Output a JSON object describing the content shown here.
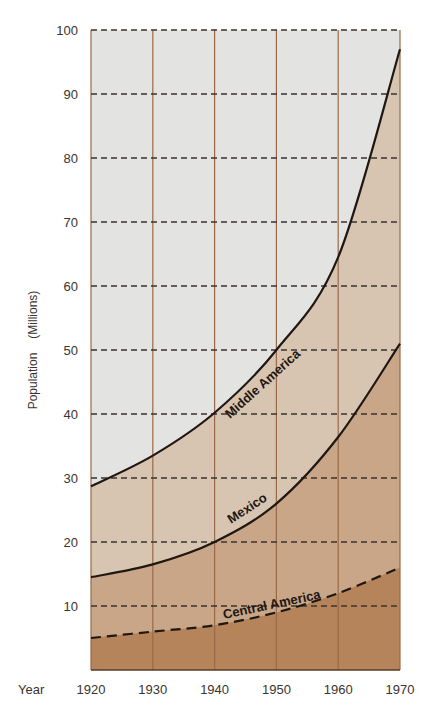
{
  "chart_data": {
    "type": "area",
    "title": "",
    "xlabel": "Year",
    "ylabel": "Population (Millions)",
    "x": [
      1920,
      1930,
      1940,
      1950,
      1960,
      1970
    ],
    "xlim": [
      1920,
      1970
    ],
    "ylim": [
      0,
      100
    ],
    "yticks": [
      10,
      20,
      30,
      40,
      50,
      60,
      70,
      80,
      90,
      100
    ],
    "xticks": [
      1920,
      1930,
      1940,
      1950,
      1960,
      1970
    ],
    "grid": {
      "horizontal": "dashed",
      "vertical": "solid"
    },
    "legend": "inline labels along curves",
    "series": [
      {
        "name": "Middle America",
        "values": [
          28.7,
          33.5,
          40.2,
          50,
          64.5,
          97
        ],
        "line": "solid",
        "fill": "#d8c5b1"
      },
      {
        "name": "Mexico",
        "values": [
          14.5,
          16.5,
          20,
          26,
          36.4,
          51
        ],
        "line": "solid",
        "fill": "#c8a687"
      },
      {
        "name": "Central America",
        "values": [
          5,
          6,
          7,
          9,
          12,
          16
        ],
        "line": "dashed",
        "fill": "#b5845b"
      }
    ]
  },
  "labels": {
    "year": "Year",
    "ylabel_population": "Population",
    "ylabel_unit": "(Millions)"
  },
  "colors": {
    "background_area": "#e3e3e1",
    "middle_america_fill": "#d8c5b1",
    "mexico_fill": "#c8a687",
    "central_america_fill": "#b5845b",
    "vertical_grid": "#9a6a48",
    "horizontal_grid": "#3a3330",
    "curve": "#1f1712"
  }
}
